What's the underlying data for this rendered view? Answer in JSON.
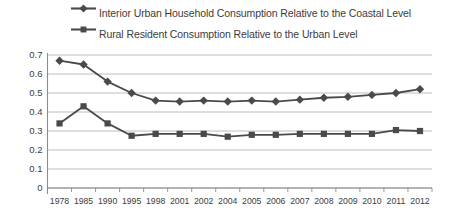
{
  "chart_data": {
    "type": "line",
    "title": "",
    "xlabel": "",
    "ylabel": "",
    "categories": [
      "1978",
      "1985",
      "1990",
      "1995",
      "1998",
      "2001",
      "2002",
      "2004",
      "2005",
      "2006",
      "2007",
      "2008",
      "2009",
      "2010",
      "2011",
      "2012"
    ],
    "ylim": [
      0,
      0.7
    ],
    "yticks": [
      "0",
      "0.1",
      "0.2",
      "0.3",
      "0.4",
      "0.5",
      "0.6",
      "0.7"
    ],
    "ytick_values": [
      0,
      0.1,
      0.2,
      0.3,
      0.4,
      0.5,
      0.6,
      0.7
    ],
    "grid": true,
    "legend_position": "top",
    "series": [
      {
        "name": "Interior Urban Household Consumption Relative to the Coastal Level",
        "marker": "diamond",
        "color": "#4a4a4a",
        "values": [
          0.67,
          0.65,
          0.56,
          0.5,
          0.46,
          0.455,
          0.46,
          0.455,
          0.46,
          0.455,
          0.465,
          0.475,
          0.48,
          0.49,
          0.5,
          0.52
        ]
      },
      {
        "name": "Rural Resident Consumption Relative to the Urban Level",
        "marker": "square",
        "color": "#4a4a4a",
        "values": [
          0.34,
          0.43,
          0.34,
          0.275,
          0.285,
          0.285,
          0.285,
          0.27,
          0.28,
          0.28,
          0.285,
          0.285,
          0.285,
          0.285,
          0.305,
          0.3
        ]
      }
    ]
  },
  "legend": {
    "items": [
      {
        "label": "Interior Urban Household Consumption Relative to the Coastal Level",
        "marker": "diamond"
      },
      {
        "label": "Rural Resident Consumption Relative to the Urban Level",
        "marker": "square"
      }
    ]
  },
  "colors": {
    "series_line": "#4a4a4a",
    "grid": "#b7b7b7",
    "axis": "#8c8c8c",
    "text": "#3c3c3c",
    "background": "#ffffff"
  }
}
